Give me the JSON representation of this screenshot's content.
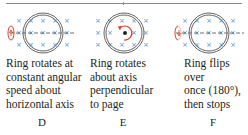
{
  "figure": {
    "panels": [
      {
        "id": "D",
        "label": "D",
        "caption": "Ring rotates at\nconstant angular\nspeed about\nhorizontal axis",
        "rotation_indicator": "horizontal-axis-rotation"
      },
      {
        "id": "E",
        "label": "E",
        "caption": "Ring rotates\nabout axis\nperpendicular\nto page",
        "rotation_indicator": "perpendicular-axis-rotation"
      },
      {
        "id": "F",
        "label": "F",
        "caption": "Ring flips over\nonce (180°),\nthen stops",
        "rotation_indicator": "horizontal-axis-flip"
      }
    ],
    "field_symbol": "×",
    "colors": {
      "field": "#4a90c8",
      "ring": "#555555",
      "arrow": "#d9432b",
      "axis": "#4a4a4a"
    }
  }
}
